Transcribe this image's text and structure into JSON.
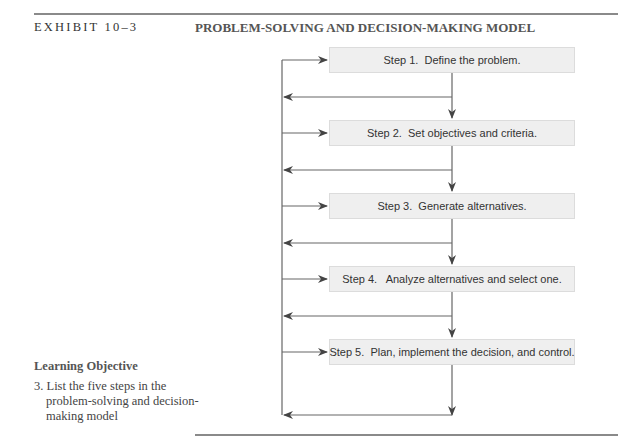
{
  "header": {
    "exhibit_label": "EXHIBIT 10–3",
    "title": "PROBLEM-SOLVING AND DECISION-MAKING MODEL"
  },
  "learning_objective": {
    "heading": "Learning Objective",
    "item": "3. List the five steps in the problem-solving and decision-making model"
  },
  "steps": [
    {
      "label": "Step 1.  Define the problem."
    },
    {
      "label": "Step 2.  Set objectives and criteria."
    },
    {
      "label": "Step 3.  Generate alternatives."
    },
    {
      "label": "Step 4.   Analyze alternatives and select one."
    },
    {
      "label": "Step 5.  Plan, implement the decision, and control."
    }
  ],
  "colors": {
    "box_fill": "#efefef",
    "box_border": "#dcdcdc",
    "line": "#555555",
    "rule": "#8a8a8a"
  }
}
